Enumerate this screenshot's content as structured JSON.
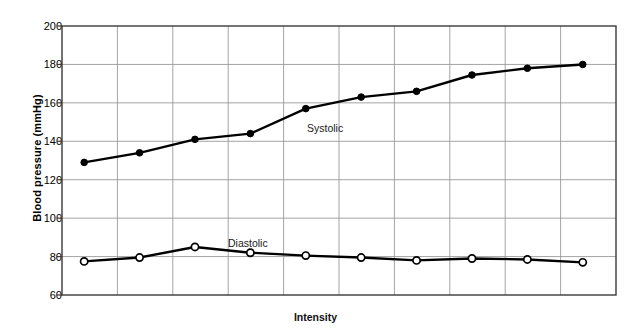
{
  "chart_data": {
    "type": "line",
    "title": "",
    "xlabel": "Intensity",
    "ylabel": "Blood pressure (mmHg)",
    "ylim": [
      60,
      200
    ],
    "yticks": [
      60,
      80,
      100,
      120,
      140,
      160,
      180,
      200
    ],
    "ytick_labels": [
      "60",
      "80",
      "100",
      "120",
      "140",
      "160",
      "180",
      "200"
    ],
    "xlim": [
      0,
      10
    ],
    "xticks": [],
    "xtick_labels": [],
    "grid": true,
    "legend_position": "inline-annotation",
    "x": [
      0.4,
      1.4,
      2.4,
      3.4,
      4.4,
      5.4,
      6.4,
      7.4,
      8.4,
      9.4
    ],
    "series": [
      {
        "name": "Systolic",
        "marker": "filled-circle",
        "color": "#000000",
        "values": [
          129,
          134,
          141,
          144,
          157,
          163,
          166,
          174.5,
          178,
          180
        ]
      },
      {
        "name": "Diastolic",
        "marker": "open-circle",
        "color": "#000000",
        "values": [
          77.5,
          79.5,
          85,
          82,
          80.5,
          79.5,
          78,
          79,
          78.5,
          77
        ]
      }
    ],
    "annotations": [
      {
        "text": "Systolic",
        "x_px": 307,
        "y_px": 122
      },
      {
        "text": "Diastolic",
        "x_px": 228,
        "y_px": 237
      }
    ]
  },
  "axis": {
    "y_title": "Blood pressure (mmHg)",
    "x_title": "Intensity",
    "y_labels": [
      "200",
      "180",
      "160",
      "140",
      "120",
      "100",
      "80",
      "60"
    ]
  },
  "colors": {
    "line": "#141414",
    "grid": "#9a9a9a",
    "frame": "#3a3a3a",
    "background": "#ffffff",
    "marker_fill_open": "#ffffff"
  }
}
